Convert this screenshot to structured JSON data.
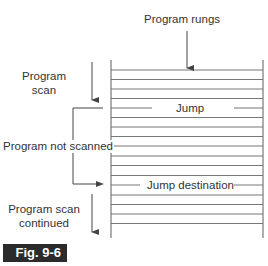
{
  "diagram": {
    "labels": {
      "program_rungs": "Program rungs",
      "program_scan_line1": "Program",
      "program_scan_line2": "scan",
      "program_not_scanned": "Program not scanned",
      "program_scan_continued_line1": "Program scan",
      "program_scan_continued_line2": "continued",
      "jump": "Jump",
      "jump_destination": "Jump destination"
    },
    "figure_label": "Fig. 9-6",
    "rungs": {
      "count": 17,
      "first_y": 70,
      "spacing": 9.6,
      "jump_index": 4,
      "destination_index": 12
    },
    "colors": {
      "line": "#6e6e6e",
      "text": "#333333",
      "fig_bg": "#2b2b2b",
      "fig_text": "#ffffff"
    }
  }
}
